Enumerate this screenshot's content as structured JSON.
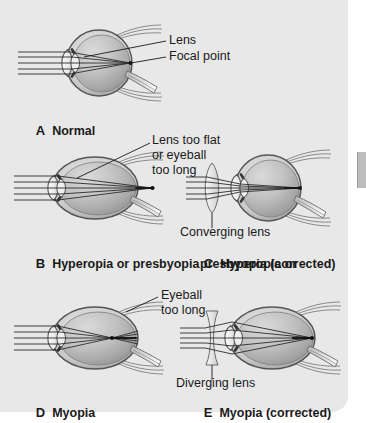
{
  "figure": {
    "background_color": "#e8e8e8",
    "panels": [
      {
        "letter": "A",
        "caption": "Normal",
        "eye_type": "normal",
        "annotations": [
          "Lens",
          "Focal point"
        ],
        "corrective_lens": "none",
        "focal_point": "on retina"
      },
      {
        "letter": "B",
        "caption": "Hyperopia or presbyopia",
        "eye_type": "normal",
        "annotations": [
          "Lens too flat",
          "or eyeball",
          "too long"
        ],
        "corrective_lens": "none",
        "focal_point": "behind retina"
      },
      {
        "letter": "C",
        "caption_line1": "Hyperopia or",
        "caption_line2": "presbyopia (corrected)",
        "eye_type": "normal",
        "annotations": [
          "Converging lens"
        ],
        "corrective_lens": "converging",
        "focal_point": "on retina"
      },
      {
        "letter": "D",
        "caption": "Myopia",
        "eye_type": "elongated",
        "annotations": [
          "Eyeball",
          "too long"
        ],
        "corrective_lens": "none",
        "focal_point": "in front of retina"
      },
      {
        "letter": "E",
        "caption": "Myopia (corrected)",
        "eye_type": "elongated",
        "annotations": [
          "Diverging lens"
        ],
        "corrective_lens": "diverging",
        "focal_point": "on retina"
      }
    ]
  },
  "labels": {
    "lens": "Lens",
    "focal_point": "Focal point",
    "lens_too_flat_l1": "Lens too flat",
    "lens_too_flat_l2": "or eyeball",
    "lens_too_flat_l3": "too long",
    "converging_lens": "Converging lens",
    "eyeball_too_long_l1": "Eyeball",
    "eyeball_too_long_l2": "too long",
    "diverging_lens": "Diverging lens"
  },
  "captions": {
    "a_letter": "A",
    "a_text": "Normal",
    "b_letter": "B",
    "b_text": "Hyperopia or presbyopia",
    "c_letter": "C",
    "c_text_l1": "Hyperopia or",
    "c_text_l2": "presbyopia (corrected)",
    "d_letter": "D",
    "d_text": "Myopia",
    "e_letter": "E",
    "e_text": "Myopia (corrected)"
  },
  "colors": {
    "background": "#e8e8e8",
    "sclera_outline": "#4a4a4a",
    "vitreous_light": "#cfcfcf",
    "vitreous_dark": "#9a9a9a",
    "cornea": "#f2f2f2",
    "ray_line": "#2b2b2b",
    "text": "#1a1a1a",
    "page_white": "#ffffff",
    "edge_tab": "#bdbdbd"
  }
}
